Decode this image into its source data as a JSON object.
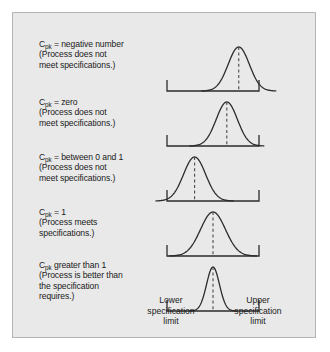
{
  "figure": {
    "background_color": "#e9e9e9",
    "border_color": "#b4b4b4",
    "curve_color": "#2b2b2b",
    "axis_color": "#2b2b2b",
    "center_line_color": "#4a4a4a",
    "rows": [
      {
        "id": "cpk-negative",
        "label_lines": [
          {
            "prefix": "C",
            "sub": "pk",
            "rest": " = negative number"
          },
          {
            "prefix": "",
            "sub": "",
            "rest": "(Process does not"
          },
          {
            "prefix": "",
            "sub": "",
            "rest": "meet specifications.)"
          }
        ],
        "curve": {
          "center_pct": 78,
          "sigma_pct": 11.5,
          "peak_height": 44
        },
        "center_line": true
      },
      {
        "id": "cpk-zero",
        "label_lines": [
          {
            "prefix": "C",
            "sub": "pk",
            "rest": " = zero"
          },
          {
            "prefix": "",
            "sub": "",
            "rest": "(Process does not"
          },
          {
            "prefix": "",
            "sub": "",
            "rest": "meet specifications.)"
          }
        ],
        "curve": {
          "center_pct": 65,
          "sigma_pct": 11.5,
          "peak_height": 44
        },
        "center_line": true
      },
      {
        "id": "cpk-between-0-and-1",
        "label_lines": [
          {
            "prefix": "C",
            "sub": "pk",
            "rest": " = between 0 and 1"
          },
          {
            "prefix": "",
            "sub": "",
            "rest": "(Process does not"
          },
          {
            "prefix": "",
            "sub": "",
            "rest": "meet specifications.)"
          }
        ],
        "curve": {
          "center_pct": 30,
          "sigma_pct": 12,
          "peak_height": 44
        },
        "center_line": true
      },
      {
        "id": "cpk-equals-1",
        "label_lines": [
          {
            "prefix": "C",
            "sub": "pk",
            "rest": " = 1"
          },
          {
            "prefix": "",
            "sub": "",
            "rest": "(Process meets"
          },
          {
            "prefix": "",
            "sub": "",
            "rest": "specifications.)"
          }
        ],
        "curve": {
          "center_pct": 50,
          "sigma_pct": 13.5,
          "peak_height": 44
        },
        "center_line": true
      },
      {
        "id": "cpk-greater-than-1",
        "label_lines": [
          {
            "prefix": "C",
            "sub": "pk",
            "rest": " greater than 1"
          },
          {
            "prefix": "",
            "sub": "",
            "rest": "(Process is better than"
          },
          {
            "prefix": "",
            "sub": "",
            "rest": "the specification"
          },
          {
            "prefix": "",
            "sub": "",
            "rest": "requires.)"
          }
        ],
        "curve": {
          "center_pct": 50,
          "sigma_pct": 7,
          "peak_height": 44
        },
        "center_line": true
      }
    ],
    "axis_captions": {
      "lower": [
        "Lower",
        "specification",
        "limit"
      ],
      "upper": [
        "Upper",
        "specification",
        "limit"
      ]
    }
  },
  "chart_data": {
    "type": "line",
    "xlabel": "",
    "ylabel": "",
    "grid": false,
    "legend": "none",
    "axis_markers": {
      "lower_specification_limit_pct": 0,
      "upper_specification_limit_pct": 100
    },
    "series": [
      {
        "name": "Cpk = negative number",
        "distribution": "normal",
        "mean_pct_of_spec_width": 78,
        "sigma_pct_of_spec_width": 11.5,
        "note": "Process does not meet specifications."
      },
      {
        "name": "Cpk = zero",
        "distribution": "normal",
        "mean_pct_of_spec_width": 65,
        "sigma_pct_of_spec_width": 11.5,
        "note": "Process does not meet specifications."
      },
      {
        "name": "Cpk = between 0 and 1",
        "distribution": "normal",
        "mean_pct_of_spec_width": 30,
        "sigma_pct_of_spec_width": 12,
        "note": "Process does not meet specifications."
      },
      {
        "name": "Cpk = 1",
        "distribution": "normal",
        "mean_pct_of_spec_width": 50,
        "sigma_pct_of_spec_width": 13.5,
        "note": "Process meets specifications."
      },
      {
        "name": "Cpk greater than 1",
        "distribution": "normal",
        "mean_pct_of_spec_width": 50,
        "sigma_pct_of_spec_width": 7,
        "note": "Process is better than the specification requires."
      }
    ]
  }
}
